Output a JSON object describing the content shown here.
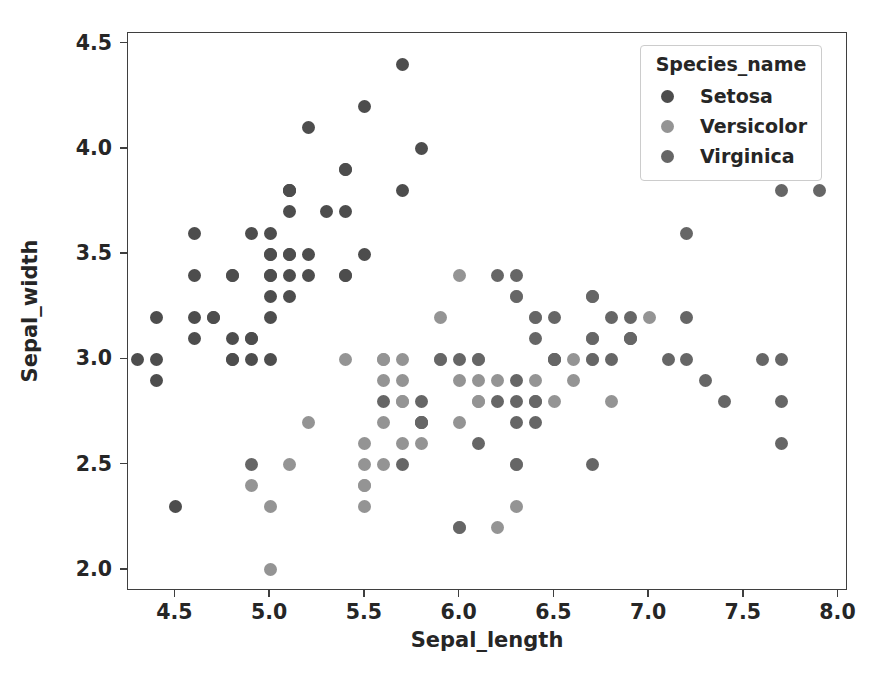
{
  "chart_data": {
    "type": "scatter",
    "title": "",
    "xlabel": "Sepal_length",
    "ylabel": "Sepal_width",
    "xlim": [
      4.25,
      8.05
    ],
    "ylim": [
      1.9,
      4.55
    ],
    "xticks": [
      "4.5",
      "5.0",
      "5.5",
      "6.0",
      "6.5",
      "7.0",
      "7.5",
      "8.0"
    ],
    "xtick_values": [
      4.5,
      5.0,
      5.5,
      6.0,
      6.5,
      7.0,
      7.5,
      8.0
    ],
    "yticks": [
      "2.0",
      "2.5",
      "3.0",
      "3.5",
      "4.0",
      "4.5"
    ],
    "ytick_values": [
      2.0,
      2.5,
      3.0,
      3.5,
      4.0,
      4.5
    ],
    "grid": false,
    "legend": {
      "title": "Species_name",
      "position": "upper right",
      "entries": [
        {
          "label": "Setosa",
          "color": "#4d4d4d"
        },
        {
          "label": "Versicolor",
          "color": "#949494"
        },
        {
          "label": "Virginica",
          "color": "#666666"
        }
      ]
    },
    "series": [
      {
        "name": "Setosa",
        "color": "#4d4d4d",
        "points": [
          [
            5.1,
            3.5
          ],
          [
            4.9,
            3.0
          ],
          [
            4.7,
            3.2
          ],
          [
            4.6,
            3.1
          ],
          [
            5.0,
            3.6
          ],
          [
            5.4,
            3.9
          ],
          [
            4.6,
            3.4
          ],
          [
            5.0,
            3.4
          ],
          [
            4.4,
            2.9
          ],
          [
            4.9,
            3.1
          ],
          [
            5.4,
            3.7
          ],
          [
            4.8,
            3.4
          ],
          [
            4.8,
            3.0
          ],
          [
            4.3,
            3.0
          ],
          [
            5.8,
            4.0
          ],
          [
            5.7,
            4.4
          ],
          [
            5.4,
            3.9
          ],
          [
            5.1,
            3.5
          ],
          [
            5.7,
            3.8
          ],
          [
            5.1,
            3.8
          ],
          [
            5.4,
            3.4
          ],
          [
            5.1,
            3.7
          ],
          [
            4.6,
            3.6
          ],
          [
            5.1,
            3.3
          ],
          [
            4.8,
            3.4
          ],
          [
            5.0,
            3.0
          ],
          [
            5.0,
            3.4
          ],
          [
            5.2,
            3.5
          ],
          [
            5.2,
            3.4
          ],
          [
            4.7,
            3.2
          ],
          [
            4.8,
            3.1
          ],
          [
            5.4,
            3.4
          ],
          [
            5.2,
            4.1
          ],
          [
            5.5,
            4.2
          ],
          [
            4.9,
            3.1
          ],
          [
            5.0,
            3.2
          ],
          [
            5.5,
            3.5
          ],
          [
            4.9,
            3.6
          ],
          [
            4.4,
            3.0
          ],
          [
            5.1,
            3.4
          ],
          [
            5.0,
            3.5
          ],
          [
            4.5,
            2.3
          ],
          [
            4.4,
            3.2
          ],
          [
            5.0,
            3.5
          ],
          [
            5.1,
            3.8
          ],
          [
            4.8,
            3.0
          ],
          [
            5.1,
            3.8
          ],
          [
            4.6,
            3.2
          ],
          [
            5.3,
            3.7
          ],
          [
            5.0,
            3.3
          ]
        ]
      },
      {
        "name": "Versicolor",
        "color": "#949494",
        "points": [
          [
            7.0,
            3.2
          ],
          [
            6.4,
            3.2
          ],
          [
            6.9,
            3.1
          ],
          [
            5.5,
            2.3
          ],
          [
            6.5,
            2.8
          ],
          [
            5.7,
            2.8
          ],
          [
            6.3,
            3.3
          ],
          [
            4.9,
            2.4
          ],
          [
            6.6,
            2.9
          ],
          [
            5.2,
            2.7
          ],
          [
            5.0,
            2.0
          ],
          [
            5.9,
            3.0
          ],
          [
            6.0,
            2.2
          ],
          [
            6.1,
            2.9
          ],
          [
            5.6,
            2.9
          ],
          [
            6.7,
            3.1
          ],
          [
            5.6,
            3.0
          ],
          [
            5.8,
            2.7
          ],
          [
            6.2,
            2.2
          ],
          [
            5.6,
            2.5
          ],
          [
            5.9,
            3.2
          ],
          [
            6.1,
            2.8
          ],
          [
            6.3,
            2.5
          ],
          [
            6.1,
            2.8
          ],
          [
            6.4,
            2.9
          ],
          [
            6.6,
            3.0
          ],
          [
            6.8,
            2.8
          ],
          [
            6.7,
            3.0
          ],
          [
            6.0,
            2.9
          ],
          [
            5.7,
            2.6
          ],
          [
            5.5,
            2.4
          ],
          [
            5.5,
            2.4
          ],
          [
            5.8,
            2.7
          ],
          [
            6.0,
            2.7
          ],
          [
            5.4,
            3.0
          ],
          [
            6.0,
            3.4
          ],
          [
            6.7,
            3.1
          ],
          [
            6.3,
            2.3
          ],
          [
            5.6,
            3.0
          ],
          [
            5.5,
            2.5
          ],
          [
            5.5,
            2.6
          ],
          [
            6.1,
            3.0
          ],
          [
            5.8,
            2.6
          ],
          [
            5.0,
            2.3
          ],
          [
            5.6,
            2.7
          ],
          [
            5.7,
            3.0
          ],
          [
            5.7,
            2.9
          ],
          [
            6.2,
            2.9
          ],
          [
            5.1,
            2.5
          ],
          [
            5.7,
            2.8
          ]
        ]
      },
      {
        "name": "Virginica",
        "color": "#666666",
        "points": [
          [
            6.3,
            3.3
          ],
          [
            5.8,
            2.7
          ],
          [
            7.1,
            3.0
          ],
          [
            6.3,
            2.9
          ],
          [
            6.5,
            3.0
          ],
          [
            7.6,
            3.0
          ],
          [
            4.9,
            2.5
          ],
          [
            7.3,
            2.9
          ],
          [
            6.7,
            2.5
          ],
          [
            7.2,
            3.6
          ],
          [
            6.5,
            3.2
          ],
          [
            6.4,
            2.7
          ],
          [
            6.8,
            3.0
          ],
          [
            5.7,
            2.5
          ],
          [
            5.8,
            2.8
          ],
          [
            6.4,
            3.2
          ],
          [
            6.5,
            3.0
          ],
          [
            7.7,
            3.8
          ],
          [
            7.7,
            2.6
          ],
          [
            6.0,
            2.2
          ],
          [
            6.9,
            3.2
          ],
          [
            5.6,
            2.8
          ],
          [
            7.7,
            2.8
          ],
          [
            6.3,
            2.7
          ],
          [
            6.7,
            3.3
          ],
          [
            7.2,
            3.2
          ],
          [
            6.2,
            2.8
          ],
          [
            6.1,
            3.0
          ],
          [
            6.4,
            2.8
          ],
          [
            7.2,
            3.0
          ],
          [
            7.4,
            2.8
          ],
          [
            7.9,
            3.8
          ],
          [
            6.4,
            2.8
          ],
          [
            6.3,
            2.8
          ],
          [
            6.1,
            2.6
          ],
          [
            7.7,
            3.0
          ],
          [
            6.3,
            3.4
          ],
          [
            6.4,
            3.1
          ],
          [
            6.0,
            3.0
          ],
          [
            6.9,
            3.1
          ],
          [
            6.7,
            3.1
          ],
          [
            6.9,
            3.1
          ],
          [
            5.8,
            2.7
          ],
          [
            6.8,
            3.2
          ],
          [
            6.7,
            3.3
          ],
          [
            6.7,
            3.0
          ],
          [
            6.3,
            2.5
          ],
          [
            6.5,
            3.0
          ],
          [
            6.2,
            3.4
          ],
          [
            5.9,
            3.0
          ]
        ]
      }
    ]
  }
}
